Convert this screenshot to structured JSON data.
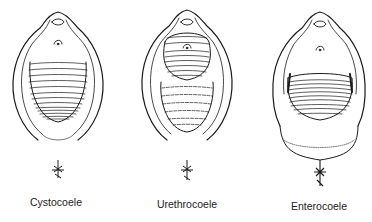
{
  "figure": {
    "panels": [
      {
        "id": "cystocoele",
        "label": "Cystocoele"
      },
      {
        "id": "urethrocoele",
        "label": "Urethrocoele"
      },
      {
        "id": "enterocoele",
        "label": "Enterocoele"
      }
    ],
    "ink_color": "#1a1a1a"
  }
}
